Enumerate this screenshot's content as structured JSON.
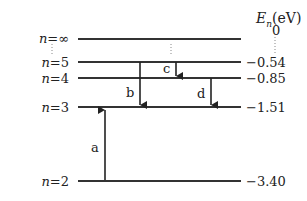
{
  "axis_label": {
    "symbol": "E",
    "subscript": "n",
    "unit": "(eV)"
  },
  "levels": [
    {
      "n_label": "n",
      "n_value": "∞",
      "energy": "0",
      "y": 39
    },
    {
      "n_label": "n",
      "n_value": "5",
      "energy": "−0.54",
      "y": 62
    },
    {
      "n_label": "n",
      "n_value": "4",
      "energy": "−0.85",
      "y": 78
    },
    {
      "n_label": "n",
      "n_value": "3",
      "energy": "−1.51",
      "y": 107
    },
    {
      "n_label": "n",
      "n_value": "2",
      "energy": "−3.40",
      "y": 181
    }
  ],
  "transitions": [
    {
      "label": "a",
      "from": "n=2",
      "to": "n=3",
      "direction": "up"
    },
    {
      "label": "b",
      "from": "n=5",
      "to": "n=3",
      "direction": "down"
    },
    {
      "label": "c",
      "from": "n=5",
      "to": "n=4",
      "direction": "down"
    },
    {
      "label": "d",
      "from": "n=4",
      "to": "n=3",
      "direction": "down"
    }
  ],
  "colors": {
    "line": "#333333",
    "text": "#222222",
    "background": "#ffffff"
  }
}
